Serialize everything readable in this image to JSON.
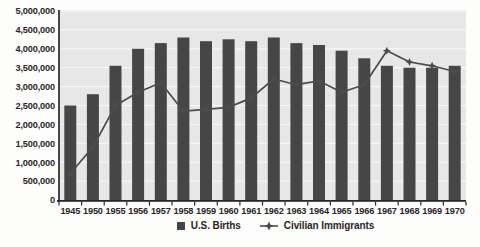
{
  "page": {
    "background": "#fdfdfc"
  },
  "chart_data": {
    "type": "bar",
    "subtype": "combo-bar-line",
    "title": "",
    "xlabel": "",
    "ylabel": "",
    "categories": [
      "1945",
      "1950",
      "1955",
      "1956",
      "1957",
      "1958",
      "1959",
      "1960",
      "1961",
      "1962",
      "1963",
      "1964",
      "1965",
      "1966",
      "1967",
      "1968",
      "1969",
      "1970"
    ],
    "series": [
      {
        "name": "U.S. Births",
        "type": "bar",
        "color": "#464649",
        "values": [
          2500000,
          2800000,
          3550000,
          4000000,
          4150000,
          4300000,
          4200000,
          4250000,
          4200000,
          4300000,
          4150000,
          4100000,
          3950000,
          3750000,
          3550000,
          3500000,
          3500000,
          3550000
        ]
      },
      {
        "name": "Civilian Immigrants",
        "type": "line",
        "marker": "four-point-star",
        "color": "#4c4c4f",
        "values": [
          700000,
          1400000,
          2500000,
          2850000,
          3100000,
          2350000,
          2400000,
          2450000,
          2700000,
          3200000,
          3050000,
          3150000,
          2850000,
          3050000,
          3950000,
          3650000,
          3550000,
          3400000
        ]
      }
    ],
    "ylim": [
      0,
      5000000
    ],
    "ytick_step": 500000,
    "y_tick_labels": [
      "0",
      "500,000",
      "1,000,000",
      "1,500,000",
      "2,000,000",
      "2,500,000",
      "3,000,000",
      "3,500,000",
      "4,000,000",
      "4,500,000",
      "5,000,000"
    ],
    "grid": "horizontal",
    "plot_bg": "#e8e7e7",
    "gridline_color": "#fafafa",
    "axis_color": "#2b2629",
    "text_color": "#2b2629",
    "legend_position": "bottom-center"
  },
  "legend": {
    "births_label": "U.S. Births",
    "immigrants_label": "Civilian Immigrants"
  }
}
